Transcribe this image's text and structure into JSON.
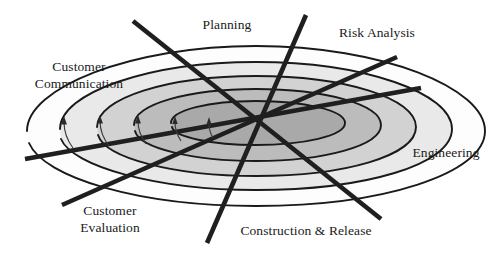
{
  "diagram": {
    "type": "spiral-process-model",
    "background_color": "#ffffff",
    "center": {
      "x": 256,
      "y": 120
    },
    "labels": [
      {
        "key": "planning",
        "text": "Planning",
        "x": 182,
        "y": 17,
        "w": 90,
        "lines": 1
      },
      {
        "key": "risk",
        "text": "Risk Analysis",
        "x": 322,
        "y": 25,
        "w": 110,
        "lines": 1
      },
      {
        "key": "customer_comm",
        "text": "Customer\nCommunication",
        "x": 18,
        "y": 58,
        "w": 122,
        "lines": 2
      },
      {
        "key": "engineering",
        "text": "Engineering",
        "x": 396,
        "y": 145,
        "w": 100,
        "lines": 1
      },
      {
        "key": "construction",
        "text": "Construction & Release",
        "x": 226,
        "y": 223,
        "w": 160,
        "lines": 1
      },
      {
        "key": "customer_eval",
        "text": "Customer\nEvaluation",
        "x": 60,
        "y": 202,
        "w": 100,
        "lines": 2
      }
    ],
    "bands": [
      {
        "name": "outer-band",
        "fill": "#ffffff"
      },
      {
        "name": "second-band",
        "fill": "#e8e8e8"
      },
      {
        "name": "third-band",
        "fill": "#d2d2d2"
      },
      {
        "name": "fourth-band",
        "fill": "#bcbcbc"
      },
      {
        "name": "inner-core-band",
        "fill": "#a8a8a8"
      }
    ],
    "stroke_color": "#1a1a1a",
    "axis_lines": 4,
    "progress_arrows": 5
  }
}
